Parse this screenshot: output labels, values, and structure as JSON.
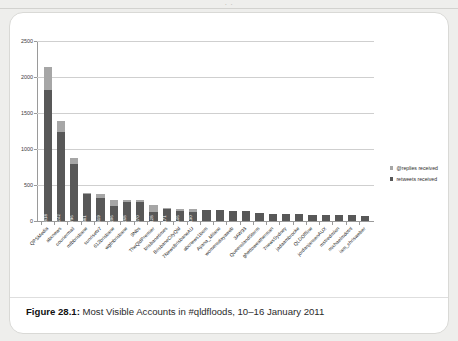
{
  "page": {
    "top_cropped_text": "· ·",
    "caption_prefix": "Figure 28.1:",
    "caption_text": " Most Visible Accounts in #qldfloods, 10–16 January 2011"
  },
  "legend": {
    "position": "right",
    "items": [
      {
        "label": "@replies received",
        "color": "#a6a6a6",
        "swatch_name": "replies-swatch"
      },
      {
        "label": "retweets received",
        "color": "#585858",
        "swatch_name": "retweets-swatch"
      }
    ]
  },
  "chart_data": {
    "type": "bar",
    "subtype": "stacked-bar",
    "title": "",
    "xlabel": "",
    "ylabel": "",
    "ylim": [
      0,
      2500
    ],
    "yticks": [
      0,
      500,
      1000,
      1500,
      2000,
      2500
    ],
    "ytick_labels": [
      "0",
      "500",
      "1000",
      "1500",
      "2000",
      "2500"
    ],
    "grid": true,
    "grid_axis": "y",
    "legend_position": "right",
    "colors": {
      "retweets": "#585858",
      "replies": "#a6a6a6"
    },
    "categories": [
      "QPSMedia",
      "abcnews",
      "couriermail",
      "mtbbrisbane",
      "sunrisetv7",
      "612brisbane",
      "wgtnbrisbane",
      "9Nbs",
      "TheQldPremier",
      "brisbanetimes",
      "BrisbaneCityQld",
      "7NewsBrisbaneAU",
      "abcnews1bom",
      "Ayana_Milano",
      "womensdayaweb",
      "3AW93",
      "QueenslandStorm",
      "ghettoweatherman",
      "7newsSydney",
      "jadaambrocke",
      "QLDOffline",
      "jordanjansenAUX",
      "mstredmlon",
      "michaelmdotnl",
      "iam_chrisweber"
    ],
    "series": [
      {
        "name": "retweets received",
        "color": "#585858",
        "values": [
          1818,
          1242,
          796,
          381,
          319,
          206,
          268,
          270,
          128,
          171,
          146,
          130,
          151,
          147,
          145,
          137,
          108,
          104,
          101,
          92,
          88,
          85,
          82,
          78,
          74
        ]
      },
      {
        "name": "@replies received",
        "color": "#a6a6a6",
        "values": [
          325,
          148,
          86,
          8,
          54,
          92,
          24,
          24,
          97,
          8,
          18,
          30,
          0,
          0,
          0,
          0,
          0,
          0,
          0,
          0,
          0,
          0,
          0,
          0,
          0
        ]
      }
    ],
    "totals": [
      2143,
      1390,
      882,
      389,
      373,
      298,
      292,
      294,
      225,
      179,
      164,
      160,
      151,
      147,
      145,
      137,
      108,
      104,
      101,
      92,
      88,
      85,
      82,
      78,
      74
    ],
    "bar_value_labels": [
      "1818",
      "1242",
      "796",
      "381",
      "319",
      "206",
      "268",
      "270",
      "128",
      "171",
      "146",
      "130",
      "",
      "",
      "",
      "",
      "",
      "",
      "",
      "",
      "",
      "",
      "",
      "",
      ""
    ]
  }
}
